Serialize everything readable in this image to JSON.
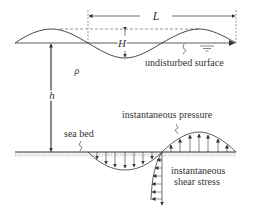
{
  "diagram": {
    "labels": {
      "wavelength": "L",
      "wave_height": "H",
      "density": "ρ",
      "depth": "h",
      "undisturbed_surface": "undisturbed surface",
      "sea_bed": "sea bed",
      "instantaneous_pressure": "instantaneous pressure",
      "instantaneous_shear_line1": "instantaneous",
      "instantaneous_shear_line2": "shear stress"
    },
    "colors": {
      "line": "#333333",
      "background": "#ffffff",
      "seabed_hatch": "#bbbbbb"
    }
  }
}
